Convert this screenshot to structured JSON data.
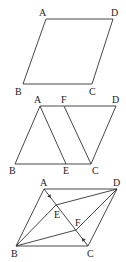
{
  "figures": [
    {
      "id": "fig1",
      "description": "parallelogram ABCD",
      "points": {
        "A": {
          "x": 46,
          "y": 19,
          "label": "A",
          "lx": 39,
          "ly": 16
        },
        "D": {
          "x": 113,
          "y": 19,
          "label": "D",
          "lx": 111,
          "ly": 16
        },
        "B": {
          "x": 23,
          "y": 84,
          "label": "B",
          "lx": 15,
          "ly": 95
        },
        "C": {
          "x": 92,
          "y": 84,
          "label": "C",
          "lx": 89,
          "ly": 95
        }
      },
      "segments": [
        [
          "A",
          "D"
        ],
        [
          "D",
          "C"
        ],
        [
          "C",
          "B"
        ],
        [
          "B",
          "A"
        ]
      ]
    },
    {
      "id": "fig2",
      "description": "parallelogram ABCD with AE and FC",
      "points": {
        "A": {
          "x": 40,
          "y": 106,
          "label": "A",
          "lx": 34,
          "ly": 103
        },
        "F": {
          "x": 64,
          "y": 106,
          "label": "F",
          "lx": 61,
          "ly": 103
        },
        "D": {
          "x": 116,
          "y": 106,
          "label": "D",
          "lx": 112,
          "ly": 103
        },
        "B": {
          "x": 15,
          "y": 164,
          "label": "B",
          "lx": 9,
          "ly": 174
        },
        "E": {
          "x": 66,
          "y": 164,
          "label": "E",
          "lx": 63,
          "ly": 174
        },
        "C": {
          "x": 91,
          "y": 164,
          "label": "C",
          "lx": 92,
          "ly": 174
        }
      },
      "segments": [
        [
          "A",
          "D"
        ],
        [
          "D",
          "C"
        ],
        [
          "C",
          "B"
        ],
        [
          "B",
          "A"
        ],
        [
          "A",
          "E"
        ],
        [
          "F",
          "C"
        ]
      ]
    },
    {
      "id": "fig3",
      "description": "parallelogram ABCD with diagonal AC, points E and F on AC",
      "points": {
        "A": {
          "x": 44,
          "y": 189,
          "label": "A",
          "lx": 40,
          "ly": 186
        },
        "D": {
          "x": 117,
          "y": 189,
          "label": "D",
          "lx": 113,
          "ly": 186
        },
        "B": {
          "x": 16,
          "y": 246,
          "label": "B",
          "lx": 11,
          "ly": 257
        },
        "C": {
          "x": 88,
          "y": 246,
          "label": "C",
          "lx": 87,
          "ly": 257
        },
        "E": {
          "x": 56,
          "y": 205,
          "label": "E",
          "lx": 54,
          "ly": 218
        },
        "F": {
          "x": 76,
          "y": 230,
          "label": "F",
          "lx": 75,
          "ly": 226
        }
      },
      "segments": [
        [
          "A",
          "D"
        ],
        [
          "D",
          "C"
        ],
        [
          "C",
          "B"
        ],
        [
          "B",
          "A"
        ],
        [
          "A",
          "C"
        ],
        [
          "B",
          "E"
        ],
        [
          "E",
          "D"
        ],
        [
          "B",
          "F"
        ],
        [
          "F",
          "D"
        ]
      ],
      "arrows": [
        {
          "x1": 44,
          "y1": 189,
          "x2": 51,
          "y2": 198
        },
        {
          "x1": 88,
          "y1": 246,
          "x2": 82,
          "y2": 238
        }
      ]
    }
  ]
}
